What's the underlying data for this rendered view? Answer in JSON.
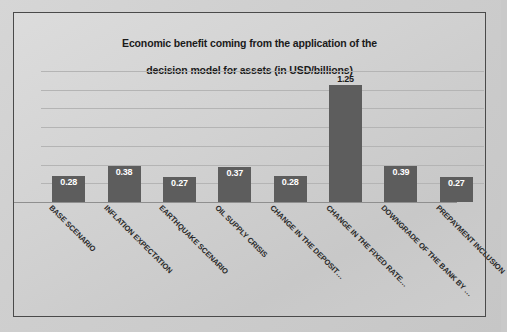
{
  "chart_data": {
    "type": "bar",
    "title": "Economic benefit coming from the application of the\ndecision model for assets (in USD/billions)",
    "title_line1": "Economic benefit coming from the application of the",
    "title_line2": "decision model for assets (in USD/billions)",
    "xlabel": "",
    "ylabel": "",
    "ylim": [
      0,
      1.4
    ],
    "grid": true,
    "gridline_values": [
      0.2,
      0.4,
      0.6,
      0.8,
      1.0,
      1.2,
      1.4
    ],
    "legend": "none",
    "axis_tick_labels": [],
    "bar_color": "#5d5d5d",
    "data_label_color": "#ffffff",
    "categories": [
      "BASE SCENARIO",
      "INFLATION EXPECTATION",
      "EARTHQUAKE SCENARIO",
      "OIL SUPPLY CRISIS",
      "CHANGE IN THE DEPOSIT…",
      "CHANGE IN THE FIXED RATE…",
      "DOWNGRADE OF THE BANK BY …",
      "PREPAYMENT INCLUSION"
    ],
    "values": [
      0.28,
      0.38,
      0.27,
      0.37,
      0.28,
      1.25,
      0.39,
      0.27
    ],
    "data_labels": [
      "0.28",
      "0.38",
      "0.27",
      "0.37",
      "0.28",
      "1.25",
      "0.39",
      "0.27"
    ]
  }
}
